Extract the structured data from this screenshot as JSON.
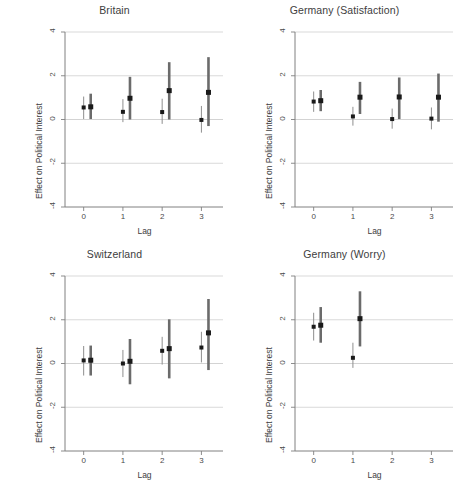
{
  "figure": {
    "width": 459,
    "height": 488,
    "background": "#ffffff",
    "ink_color": "#4a4a4a",
    "grid_color": "#c8c8c8",
    "axis_color": "#808080",
    "marker_color": "#1a1a1a",
    "thin_ci_color": "#8e8e8e",
    "thick_ci_color": "#6b6b6b"
  },
  "axes": {
    "xlabel": "Lag",
    "ylabel": "Effect on Political Interest",
    "xticks": [
      "0",
      "1",
      "2",
      "3"
    ],
    "xtick_values": [
      0,
      1,
      2,
      3
    ],
    "yticks": [
      "4",
      "2",
      "0",
      "-2",
      "-4"
    ],
    "ytick_values": [
      4,
      2,
      0,
      -2,
      -4
    ],
    "xlim": [
      -0.45,
      3.55
    ],
    "ylim": [
      -4,
      4
    ],
    "grid": "horizontal"
  },
  "chart_data": {
    "type": "scatter",
    "xlabel": "Lag",
    "ylabel": "Effect on Political Interest",
    "ylim": [
      -4,
      4
    ],
    "xlim": [
      -0.45,
      3.55
    ],
    "x": [
      0,
      1,
      2,
      3
    ],
    "grid": "horizontal gridlines at 4, 2, 0, -2",
    "legend": "none",
    "panels": [
      {
        "title": "Britain",
        "position": "top-left",
        "series": [
          {
            "name": "thin",
            "style": "thin",
            "offset": 0.0,
            "points": [
              {
                "lag": 0,
                "estimate": 0.55,
                "lower": 0.02,
                "upper": 1.05
              },
              {
                "lag": 1,
                "estimate": 0.35,
                "lower": -0.12,
                "upper": 0.93
              },
              {
                "lag": 2,
                "estimate": 0.34,
                "lower": -0.2,
                "upper": 0.95
              },
              {
                "lag": 3,
                "estimate": -0.02,
                "lower": -0.6,
                "upper": 0.62
              }
            ]
          },
          {
            "name": "thick",
            "style": "thick",
            "offset": 0.18,
            "points": [
              {
                "lag": 0,
                "estimate": 0.58,
                "lower": 0.02,
                "upper": 1.18
              },
              {
                "lag": 1,
                "estimate": 0.97,
                "lower": 0.0,
                "upper": 1.95
              },
              {
                "lag": 2,
                "estimate": 1.32,
                "lower": 0.0,
                "upper": 2.62
              },
              {
                "lag": 3,
                "estimate": 1.24,
                "lower": -0.3,
                "upper": 2.85
              }
            ]
          }
        ]
      },
      {
        "title": "Germany (Satisfaction)",
        "position": "top-right",
        "series": [
          {
            "name": "thin",
            "style": "thin",
            "offset": 0.0,
            "points": [
              {
                "lag": 0,
                "estimate": 0.82,
                "lower": 0.35,
                "upper": 1.28
              },
              {
                "lag": 1,
                "estimate": 0.14,
                "lower": -0.28,
                "upper": 0.58
              },
              {
                "lag": 2,
                "estimate": 0.02,
                "lower": -0.42,
                "upper": 0.5
              },
              {
                "lag": 3,
                "estimate": 0.04,
                "lower": -0.45,
                "upper": 0.55
              }
            ]
          },
          {
            "name": "thick",
            "style": "thick",
            "offset": 0.18,
            "points": [
              {
                "lag": 0,
                "estimate": 0.86,
                "lower": 0.38,
                "upper": 1.35
              },
              {
                "lag": 1,
                "estimate": 1.02,
                "lower": 0.25,
                "upper": 1.72
              },
              {
                "lag": 2,
                "estimate": 1.03,
                "lower": 0.02,
                "upper": 1.92
              },
              {
                "lag": 3,
                "estimate": 1.02,
                "lower": -0.1,
                "upper": 2.1
              }
            ]
          }
        ]
      },
      {
        "title": "Switzerland",
        "position": "bottom-left",
        "series": [
          {
            "name": "thin",
            "style": "thin",
            "offset": 0.0,
            "points": [
              {
                "lag": 0,
                "estimate": 0.14,
                "lower": -0.55,
                "upper": 0.8
              },
              {
                "lag": 1,
                "estimate": 0.0,
                "lower": -0.62,
                "upper": 0.62
              },
              {
                "lag": 2,
                "estimate": 0.58,
                "lower": -0.05,
                "upper": 1.22
              },
              {
                "lag": 3,
                "estimate": 0.73,
                "lower": 0.05,
                "upper": 1.45
              }
            ]
          },
          {
            "name": "thick",
            "style": "thick",
            "offset": 0.18,
            "points": [
              {
                "lag": 0,
                "estimate": 0.15,
                "lower": -0.55,
                "upper": 0.82
              },
              {
                "lag": 1,
                "estimate": 0.1,
                "lower": -0.95,
                "upper": 1.12
              },
              {
                "lag": 2,
                "estimate": 0.68,
                "lower": -0.68,
                "upper": 2.02
              },
              {
                "lag": 3,
                "estimate": 1.4,
                "lower": -0.3,
                "upper": 2.95
              }
            ]
          }
        ]
      },
      {
        "title": "Germany (Worry)",
        "position": "bottom-right",
        "series": [
          {
            "name": "thin",
            "style": "thin",
            "offset": 0.0,
            "points": [
              {
                "lag": 0,
                "estimate": 1.68,
                "lower": 1.05,
                "upper": 2.32
              },
              {
                "lag": 1,
                "estimate": 0.26,
                "lower": -0.2,
                "upper": 0.95
              }
            ]
          },
          {
            "name": "thick",
            "style": "thick",
            "offset": 0.18,
            "points": [
              {
                "lag": 0,
                "estimate": 1.75,
                "lower": 0.95,
                "upper": 2.58
              },
              {
                "lag": 1,
                "estimate": 2.05,
                "lower": 0.78,
                "upper": 3.3
              }
            ]
          }
        ]
      }
    ]
  }
}
